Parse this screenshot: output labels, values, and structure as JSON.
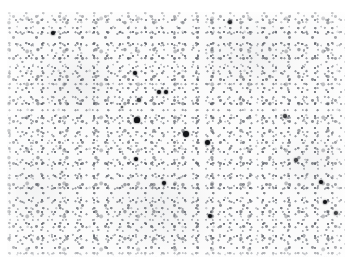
{
  "figure": {
    "kind": "micrograph",
    "modality": "brightfield-light-microscopy",
    "caption": "",
    "width_px": 353,
    "height_px": 267,
    "paper_background_color": "#ffffff",
    "specimen_background_color": "#fbfbfb",
    "stipple_color": "#64686f",
    "signal_color": "#121418",
    "panel": {
      "left": 7,
      "top": 12,
      "width": 338,
      "height": 245
    },
    "labels": [],
    "scale_bar": null,
    "annotations": []
  },
  "signal_dots": [
    {
      "id": "dot-01",
      "x": 53,
      "y": 33,
      "r": 2.1,
      "intensity": "strong"
    },
    {
      "id": "dot-02",
      "x": 230,
      "y": 22,
      "r": 2.3,
      "intensity": "strong"
    },
    {
      "id": "dot-03",
      "x": 135,
      "y": 73,
      "r": 2.0,
      "intensity": "strong"
    },
    {
      "id": "dot-04",
      "x": 159,
      "y": 92,
      "r": 2.3,
      "intensity": "strong"
    },
    {
      "id": "dot-05",
      "x": 166,
      "y": 92,
      "r": 2.2,
      "intensity": "strong"
    },
    {
      "id": "dot-06",
      "x": 139,
      "y": 100,
      "r": 1.6,
      "intensity": "medium"
    },
    {
      "id": "dot-07",
      "x": 122,
      "y": 107,
      "r": 1.3,
      "intensity": "medium"
    },
    {
      "id": "dot-08",
      "x": 137,
      "y": 120,
      "r": 2.6,
      "intensity": "strong"
    },
    {
      "id": "dot-09",
      "x": 186,
      "y": 134,
      "r": 2.9,
      "intensity": "strong"
    },
    {
      "id": "dot-10",
      "x": 207,
      "y": 142,
      "r": 2.5,
      "intensity": "strong"
    },
    {
      "id": "dot-11",
      "x": 136,
      "y": 159,
      "r": 2.1,
      "intensity": "strong"
    },
    {
      "id": "dot-12",
      "x": 285,
      "y": 116,
      "r": 1.9,
      "intensity": "medium"
    },
    {
      "id": "dot-13",
      "x": 296,
      "y": 160,
      "r": 1.8,
      "intensity": "medium"
    },
    {
      "id": "dot-14",
      "x": 164,
      "y": 183,
      "r": 2.4,
      "intensity": "strong"
    },
    {
      "id": "dot-15",
      "x": 210,
      "y": 216,
      "r": 2.3,
      "intensity": "strong"
    },
    {
      "id": "dot-16",
      "x": 321,
      "y": 182,
      "r": 2.2,
      "intensity": "strong"
    },
    {
      "id": "dot-17",
      "x": 325,
      "y": 202,
      "r": 2.0,
      "intensity": "strong"
    },
    {
      "id": "dot-18",
      "x": 336,
      "y": 213,
      "r": 2.2,
      "intensity": "strong"
    },
    {
      "id": "dot-19",
      "x": 240,
      "y": 99,
      "r": 1.4,
      "intensity": "faint"
    },
    {
      "id": "dot-20",
      "x": 62,
      "y": 172,
      "r": 1.4,
      "intensity": "faint"
    }
  ]
}
